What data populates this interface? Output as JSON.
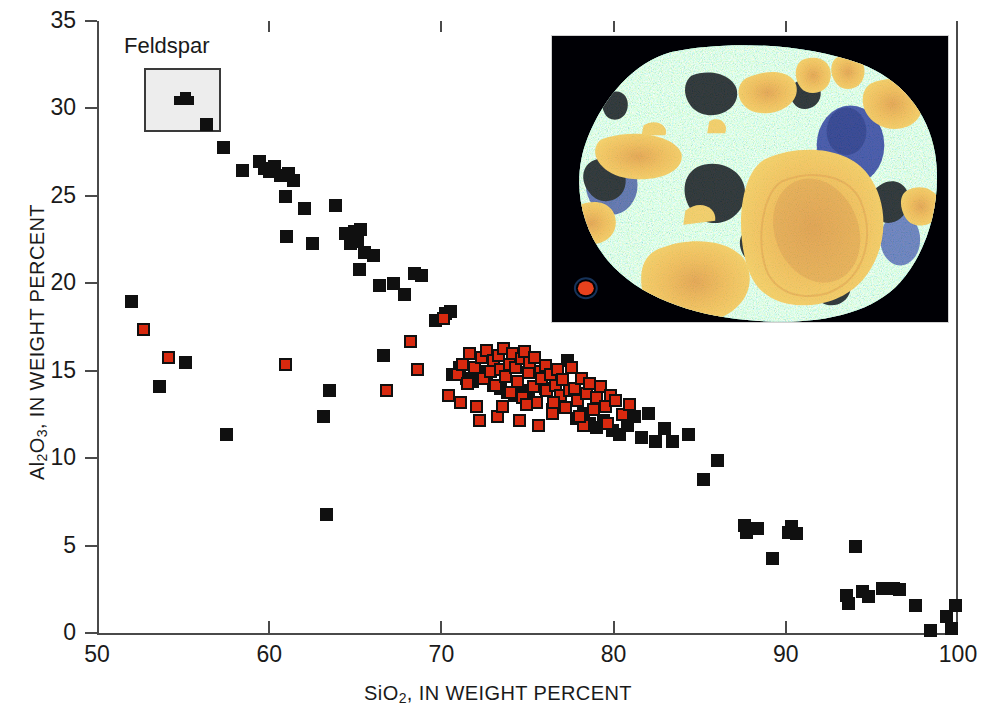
{
  "figure": {
    "axis_title_x_html": "SiO<sub>2</sub>, IN WEIGHT PERCENT",
    "axis_title_y_html": "Al<sub>2</sub>O<sub>3</sub>, IN WEIGHT PERCENT",
    "feldspar_label": "Feldspar",
    "colors": {
      "black_marker": "#101010",
      "red_marker": "#d8290f",
      "axis": "#4a4a4a",
      "legend_box_fill": "#ededed",
      "inset_background": "#000000",
      "inset_matrix_teal": "#2e9b8f",
      "inset_speckle_yellow": "#d7e34a",
      "inset_crystal_orange": "#f5b63c",
      "inset_deep_blue": "#16249a"
    },
    "inset_caption": "false-color element map of volcanic rock thin section"
  },
  "chart_data": {
    "type": "scatter",
    "title": "",
    "xlabel": "SiO2, IN WEIGHT PERCENT",
    "ylabel": "Al2O3, IN WEIGHT PERCENT",
    "xlim": [
      50,
      100
    ],
    "ylim": [
      0,
      35
    ],
    "xticks": [
      50,
      60,
      70,
      80,
      90,
      100
    ],
    "yticks": [
      0,
      5,
      10,
      15,
      20,
      25,
      30,
      35
    ],
    "grid": false,
    "legend": {
      "position": "inside-top-left",
      "entries": [
        {
          "label": "Feldspar",
          "type": "region-box",
          "x_range": [
            52.7,
            57.2
          ],
          "y_range": [
            28.6,
            32.3
          ]
        }
      ]
    },
    "series": [
      {
        "name": "black-squares",
        "marker": "filled square",
        "color": "#101010",
        "points": [
          [
            52.0,
            19.0
          ],
          [
            53.6,
            14.1
          ],
          [
            55.1,
            15.5
          ],
          [
            57.3,
            27.8
          ],
          [
            57.5,
            11.4
          ],
          [
            58.4,
            26.5
          ],
          [
            59.4,
            27.0
          ],
          [
            59.7,
            26.6
          ],
          [
            60.0,
            26.4
          ],
          [
            60.3,
            26.7
          ],
          [
            60.6,
            26.2
          ],
          [
            60.9,
            25.0
          ],
          [
            61.1,
            26.3
          ],
          [
            61.4,
            25.9
          ],
          [
            61.0,
            22.7
          ],
          [
            62.0,
            24.3
          ],
          [
            62.5,
            22.3
          ],
          [
            63.1,
            12.4
          ],
          [
            63.3,
            6.8
          ],
          [
            63.5,
            13.9
          ],
          [
            63.8,
            24.5
          ],
          [
            64.4,
            22.9
          ],
          [
            64.7,
            22.3
          ],
          [
            64.9,
            23.0
          ],
          [
            65.1,
            22.4
          ],
          [
            65.3,
            23.1
          ],
          [
            65.5,
            21.8
          ],
          [
            65.2,
            20.8
          ],
          [
            66.0,
            21.6
          ],
          [
            66.4,
            19.9
          ],
          [
            66.6,
            15.9
          ],
          [
            67.2,
            20.0
          ],
          [
            67.8,
            19.4
          ],
          [
            68.4,
            20.6
          ],
          [
            68.8,
            20.5
          ],
          [
            69.6,
            17.9
          ],
          [
            70.2,
            18.3
          ],
          [
            70.5,
            18.4
          ],
          [
            70.6,
            14.8
          ],
          [
            71.0,
            15.2
          ],
          [
            71.4,
            14.6
          ],
          [
            71.8,
            14.4
          ],
          [
            72.1,
            15.0
          ],
          [
            72.6,
            14.9
          ],
          [
            73.0,
            14.2
          ],
          [
            73.4,
            14.0
          ],
          [
            73.8,
            13.8
          ],
          [
            74.2,
            13.6
          ],
          [
            74.6,
            13.9
          ],
          [
            75.0,
            13.4
          ],
          [
            75.4,
            13.2
          ],
          [
            76.0,
            14.0
          ],
          [
            76.4,
            12.8
          ],
          [
            76.8,
            13.0
          ],
          [
            77.3,
            15.6
          ],
          [
            77.8,
            12.3
          ],
          [
            78.2,
            12.6
          ],
          [
            78.6,
            12.0
          ],
          [
            79.0,
            11.8
          ],
          [
            79.4,
            12.2
          ],
          [
            79.9,
            11.6
          ],
          [
            80.3,
            11.4
          ],
          [
            80.8,
            11.9
          ],
          [
            81.2,
            12.4
          ],
          [
            81.6,
            11.2
          ],
          [
            82.0,
            12.6
          ],
          [
            82.4,
            11.0
          ],
          [
            82.9,
            11.7
          ],
          [
            83.4,
            11.0
          ],
          [
            84.3,
            11.4
          ],
          [
            85.2,
            8.8
          ],
          [
            86.0,
            9.9
          ],
          [
            87.6,
            6.2
          ],
          [
            87.7,
            5.8
          ],
          [
            88.3,
            6.0
          ],
          [
            89.2,
            4.3
          ],
          [
            90.1,
            5.8
          ],
          [
            90.3,
            6.1
          ],
          [
            90.6,
            5.7
          ],
          [
            93.5,
            2.2
          ],
          [
            93.6,
            1.7
          ],
          [
            94.0,
            5.0
          ],
          [
            94.4,
            2.4
          ],
          [
            94.8,
            2.1
          ],
          [
            95.6,
            2.6
          ],
          [
            96.2,
            2.6
          ],
          [
            96.6,
            2.5
          ],
          [
            97.5,
            1.6
          ],
          [
            98.4,
            0.2
          ],
          [
            99.3,
            1.0
          ],
          [
            99.6,
            0.3
          ],
          [
            99.8,
            1.6
          ]
        ]
      },
      {
        "name": "red-squares",
        "marker": "filled square with black outline",
        "color": "#d8290f",
        "points": [
          [
            52.7,
            17.4
          ],
          [
            54.1,
            15.8
          ],
          [
            60.9,
            15.4
          ],
          [
            66.8,
            13.9
          ],
          [
            68.2,
            16.7
          ],
          [
            68.6,
            15.1
          ],
          [
            70.1,
            18.0
          ],
          [
            70.9,
            14.8
          ],
          [
            71.2,
            15.4
          ],
          [
            71.5,
            14.3
          ],
          [
            71.6,
            16.0
          ],
          [
            71.9,
            15.2
          ],
          [
            72.0,
            13.0
          ],
          [
            72.3,
            15.8
          ],
          [
            72.4,
            14.6
          ],
          [
            72.6,
            16.2
          ],
          [
            72.8,
            15.0
          ],
          [
            73.0,
            15.6
          ],
          [
            73.1,
            14.2
          ],
          [
            73.3,
            15.9
          ],
          [
            73.4,
            15.1
          ],
          [
            73.6,
            16.3
          ],
          [
            73.7,
            14.7
          ],
          [
            73.9,
            15.4
          ],
          [
            74.0,
            13.8
          ],
          [
            74.1,
            16.0
          ],
          [
            74.3,
            15.2
          ],
          [
            74.4,
            14.4
          ],
          [
            74.6,
            15.7
          ],
          [
            74.7,
            13.5
          ],
          [
            74.8,
            16.1
          ],
          [
            75.0,
            14.9
          ],
          [
            75.1,
            15.5
          ],
          [
            75.3,
            14.1
          ],
          [
            75.4,
            15.8
          ],
          [
            75.5,
            13.2
          ],
          [
            75.7,
            15.0
          ],
          [
            75.8,
            14.6
          ],
          [
            76.0,
            15.3
          ],
          [
            76.1,
            13.9
          ],
          [
            76.3,
            14.8
          ],
          [
            76.4,
            12.6
          ],
          [
            76.6,
            14.2
          ],
          [
            76.7,
            15.1
          ],
          [
            76.9,
            13.6
          ],
          [
            77.0,
            14.5
          ],
          [
            77.2,
            12.9
          ],
          [
            77.4,
            13.9
          ],
          [
            77.5,
            15.2
          ],
          [
            77.7,
            14.0
          ],
          [
            77.9,
            13.3
          ],
          [
            78.1,
            14.6
          ],
          [
            78.2,
            11.9
          ],
          [
            78.4,
            13.7
          ],
          [
            78.6,
            14.3
          ],
          [
            78.8,
            12.8
          ],
          [
            79.0,
            13.5
          ],
          [
            79.2,
            14.1
          ],
          [
            79.5,
            13.0
          ],
          [
            79.8,
            13.6
          ],
          [
            80.1,
            13.3
          ],
          [
            80.5,
            12.5
          ],
          [
            80.9,
            13.1
          ],
          [
            72.2,
            12.2
          ],
          [
            73.2,
            12.4
          ],
          [
            74.5,
            12.2
          ],
          [
            75.6,
            11.9
          ],
          [
            70.4,
            13.6
          ],
          [
            71.1,
            13.2
          ],
          [
            73.5,
            13.0
          ],
          [
            74.9,
            13.1
          ],
          [
            76.5,
            13.2
          ],
          [
            78.0,
            12.4
          ],
          [
            79.6,
            12.0
          ]
        ]
      }
    ]
  }
}
